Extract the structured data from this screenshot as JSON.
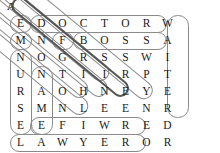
{
  "figure": {
    "panel_label": "A",
    "type": "word-search-puzzle"
  },
  "grid": {
    "rows": 8,
    "cols": 8,
    "letters": [
      [
        "E",
        "D",
        "O",
        "C",
        "T",
        "O",
        "R",
        "W"
      ],
      [
        "M",
        "N",
        "F",
        "B",
        "O",
        "S",
        "S",
        "A"
      ],
      [
        "N",
        "O",
        "G",
        "R",
        "S",
        "S",
        "W",
        "I"
      ],
      [
        "U",
        "N",
        "T",
        "I",
        "I",
        "R",
        "P",
        "T"
      ],
      [
        "R",
        "A",
        "O",
        "H",
        "N",
        "E",
        "Y",
        "E"
      ],
      [
        "S",
        "M",
        "N",
        "L",
        "E",
        "E",
        "N",
        "R"
      ],
      [
        "E",
        "E",
        "F",
        "I",
        "W",
        "R",
        "E",
        "D"
      ],
      [
        "L",
        "A",
        "W",
        "Y",
        "E",
        "R",
        "O",
        "R"
      ]
    ]
  },
  "found_words": [
    {
      "word": "DOCTOR",
      "direction": "horizontal",
      "row": 1,
      "start_col": 2,
      "end_col": 7
    },
    {
      "word": "BOSS",
      "direction": "horizontal",
      "row": 2,
      "start_col": 4,
      "end_col": 7
    },
    {
      "word": "LAWYER",
      "direction": "horizontal",
      "row": 8,
      "start_col": 1,
      "end_col": 6
    },
    {
      "word": "EFIWR",
      "direction": "horizontal",
      "row": 7,
      "start_col": 2,
      "end_col": 6
    },
    {
      "word": "NURSE",
      "direction": "vertical",
      "col": 1,
      "start_row": 3,
      "end_row": 7
    },
    {
      "word": "NAME",
      "direction": "vertical",
      "col": 2,
      "start_row": 4,
      "end_row": 7
    },
    {
      "word": "WAITER",
      "direction": "vertical",
      "col": 8,
      "start_row": 1,
      "end_row": 6
    },
    {
      "word": "ENGINEER",
      "direction": "diagonal",
      "start": [
        1,
        1
      ],
      "end": [
        8,
        8
      ],
      "emphasis": "normal"
    },
    {
      "word": "MOTHER",
      "direction": "diagonal",
      "start": [
        2,
        1
      ],
      "end": [
        7,
        6
      ],
      "emphasis": "normal"
    },
    {
      "word": "NOTHER",
      "direction": "diagonal",
      "start": [
        3,
        1
      ],
      "end": [
        8,
        6
      ],
      "emphasis": "normal"
    },
    {
      "word": "FRIEND",
      "direction": "diagonal",
      "start": [
        2,
        3
      ],
      "end": [
        7,
        8
      ],
      "emphasis": "bold"
    },
    {
      "word": "BSINER",
      "direction": "diagonal",
      "start": [
        2,
        4
      ],
      "end": [
        7,
        9
      ],
      "emphasis": "normal"
    },
    {
      "word": "DNIEER",
      "direction": "diagonal",
      "start": [
        1,
        2
      ],
      "end": [
        6,
        7
      ],
      "emphasis": "normal"
    }
  ],
  "colors": {
    "letter": "#1a1a1a",
    "oval_stroke": "#8a8a8a",
    "oval_stroke_bold": "#555555",
    "background": "#ffffff"
  }
}
